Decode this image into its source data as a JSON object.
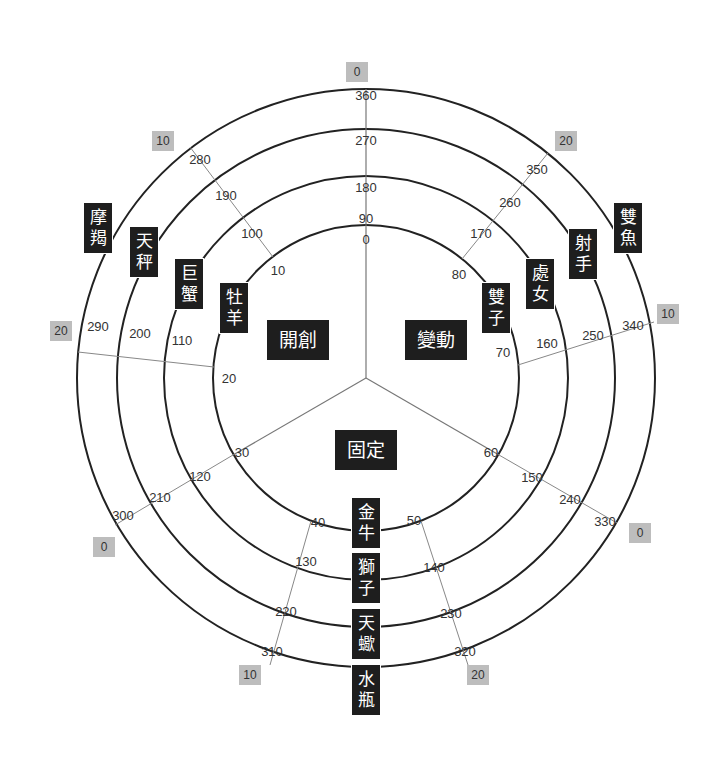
{
  "modes": {
    "cardinal": "開創",
    "mutable": "變動",
    "fixed": "固定"
  },
  "signs": {
    "aries": "牡羊",
    "cancer": "巨蟹",
    "libra": "天秤",
    "capricorn": "摩羯",
    "gemini": "雙子",
    "virgo": "處女",
    "sagittarius": "射手",
    "pisces": "雙魚",
    "taurus": "金牛",
    "leo": "獅子",
    "scorpio": "天蠍",
    "aquarius": "水瓶"
  },
  "degree_boxes": {
    "top": "0",
    "upper_left": "10",
    "upper_right": "20",
    "left": "20",
    "right": "10",
    "lower_left": "0",
    "lower_right": "0",
    "bottom_left": "10",
    "bottom_right": "20"
  },
  "ring_labels": {
    "top": [
      "0",
      "90",
      "180",
      "270",
      "360"
    ],
    "upper_left": [
      "10",
      "100",
      "190",
      "280"
    ],
    "left": [
      "20",
      "110",
      "200",
      "290"
    ],
    "lower_left": [
      "30",
      "120",
      "210",
      "300"
    ],
    "bottom_left": [
      "40",
      "130",
      "220",
      "310"
    ],
    "bottom_right": [
      "50",
      "140",
      "230",
      "320"
    ],
    "lower_right": [
      "60",
      "150",
      "240",
      "330"
    ],
    "right": [
      "70",
      "160",
      "250",
      "340"
    ],
    "upper_right": [
      "80",
      "170",
      "260",
      "350"
    ]
  }
}
